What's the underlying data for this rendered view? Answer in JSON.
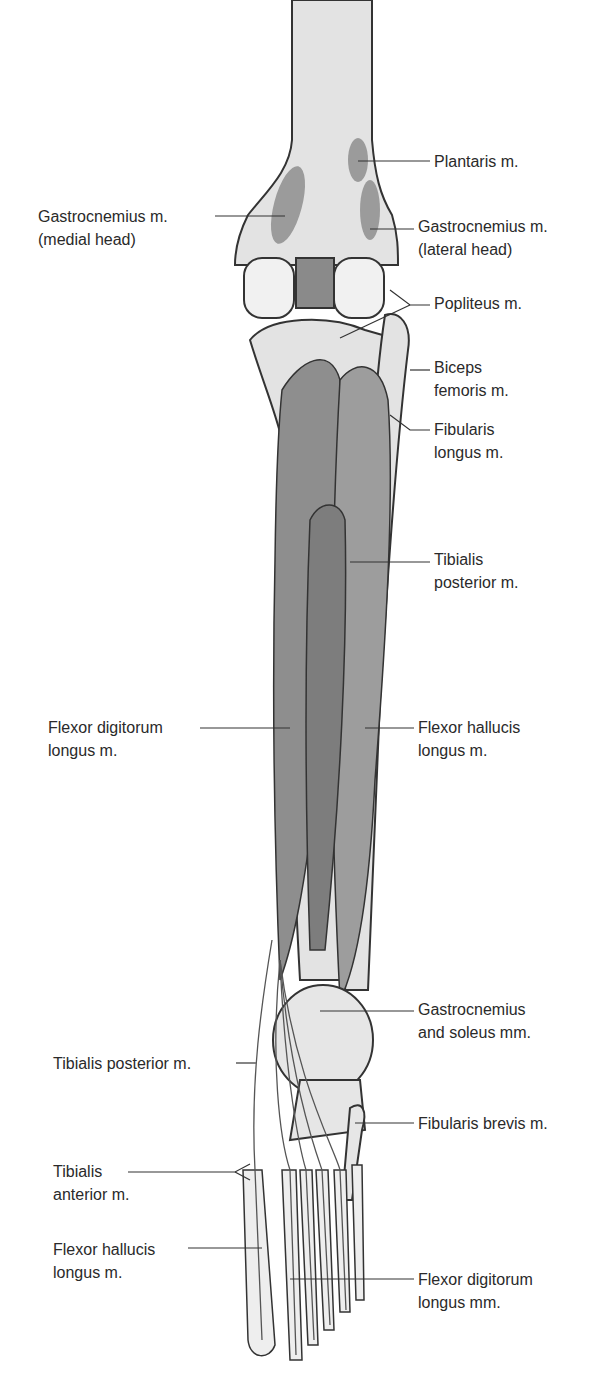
{
  "figure": {
    "colors": {
      "bone": "#e3e3e3",
      "muscle": "#9b9b9b",
      "muscle_dark": "#7d7d7d",
      "tendon": "#ececec",
      "outline": "#333333",
      "background": "#ffffff"
    }
  },
  "labels": [
    {
      "id": "plantaris",
      "text": "Plantaris m.",
      "x": 434,
      "y": 150
    },
    {
      "id": "gastrocnemius-medial",
      "text": "Gastrocnemius m.\n(medial head)",
      "x": 38,
      "y": 205
    },
    {
      "id": "gastrocnemius-lateral",
      "text": "Gastrocnemius m.\n(lateral head)",
      "x": 418,
      "y": 215
    },
    {
      "id": "popliteus",
      "text": "Popliteus m.",
      "x": 434,
      "y": 292
    },
    {
      "id": "biceps-femoris",
      "text": "Biceps\nfemoris m.",
      "x": 434,
      "y": 356
    },
    {
      "id": "fibularis-longus",
      "text": "Fibularis\nlongus m.",
      "x": 434,
      "y": 430
    },
    {
      "id": "tibialis-posterior-upper",
      "text": "Tibialis\nposterior m.",
      "x": 434,
      "y": 548
    },
    {
      "id": "flexor-digitorum-longus",
      "text": "Flexor digitorum\nlongus m.",
      "x": 48,
      "y": 716
    },
    {
      "id": "flexor-hallucis-longus-upper",
      "text": "Flexor hallucis\nlongus m.",
      "x": 418,
      "y": 716
    },
    {
      "id": "gastrocnemius-soleus",
      "text": "Gastrocnemius\nand soleus mm.",
      "x": 418,
      "y": 990
    },
    {
      "id": "tibialis-posterior-lower",
      "text": "Tibialis posterior m.",
      "x": 53,
      "y": 1032
    },
    {
      "id": "fibularis-brevis",
      "text": "Fibularis brevis m.",
      "x": 418,
      "y": 1102
    },
    {
      "id": "tibialis-anterior",
      "text": "Tibialis\nanterior m.",
      "x": 53,
      "y": 1160
    },
    {
      "id": "flexor-hallucis-longus-lower",
      "text": "Flexor hallucis\nlongus m.",
      "x": 53,
      "y": 1240
    },
    {
      "id": "flexor-digitorum-longus-mm",
      "text": "Flexor digitorum\nlongus mm.",
      "x": 418,
      "y": 1268
    }
  ]
}
